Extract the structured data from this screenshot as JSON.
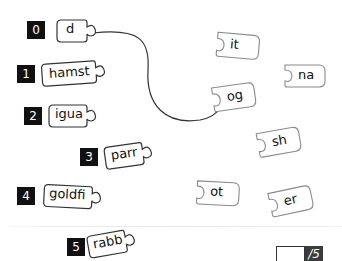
{
  "exercise": {
    "type": "word-completion-matching",
    "stems": [
      {
        "number": "0",
        "text": "d"
      },
      {
        "number": "1",
        "text": "hamst"
      },
      {
        "number": "2",
        "text": "igua"
      },
      {
        "number": "3",
        "text": "parr"
      },
      {
        "number": "4",
        "text": "goldfi"
      },
      {
        "number": "5",
        "text": "rabb"
      }
    ],
    "endings": [
      {
        "text": "it"
      },
      {
        "text": "na"
      },
      {
        "text": "og"
      },
      {
        "text": "sh"
      },
      {
        "text": "ot"
      },
      {
        "text": "er"
      }
    ],
    "example_connection": {
      "from": "d",
      "to": "og"
    }
  },
  "score": {
    "value": "",
    "total_label": "/5"
  },
  "colors": {
    "label_bg": "#111111",
    "stem_outline": "#333333",
    "ending_outline": "#8a8a8a",
    "connector": "#333333",
    "score_total_bg": "#3b3b3b"
  }
}
